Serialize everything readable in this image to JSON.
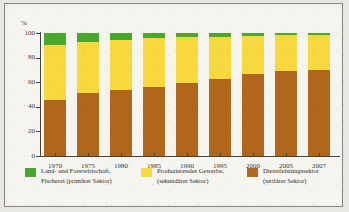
{
  "chart_data": {
    "type": "bar",
    "subtype": "100-percent-stacked-column",
    "title": "",
    "xlabel": "",
    "ylabel": "%",
    "unit_label": "%",
    "ylim": [
      0,
      100
    ],
    "yticks": [
      0,
      20,
      40,
      60,
      80,
      100
    ],
    "ytick_labels": [
      "0",
      "20",
      "40",
      "60",
      "80",
      "100"
    ],
    "grid": false,
    "legend_position": "bottom",
    "categories": [
      "1970",
      "1975",
      "1980",
      "1985",
      "1990",
      "1995",
      "2000",
      "2005",
      "2007"
    ],
    "series": [
      {
        "name": "Land- und Forstwirtschaft, Fischerei (primärer Sektor)",
        "short_name": "primärer Sektor",
        "color": "#4aa72e",
        "values": [
          9.5,
          7.0,
          5.5,
          4.0,
          3.5,
          3.0,
          2.5,
          2.0,
          2.0
        ]
      },
      {
        "name": "Produzierendes Gewerbe, (sekundärer Sektor)",
        "short_name": "sekundärer Sektor",
        "color": "#f7d83f",
        "values": [
          45.0,
          42.0,
          40.5,
          39.5,
          37.5,
          34.0,
          30.5,
          28.5,
          28.0
        ]
      },
      {
        "name": "Dienstleistungssektor (tertiärer Sektor)",
        "short_name": "tertiärer Sektor",
        "color": "#b0661b",
        "values": [
          45.5,
          51.0,
          54.0,
          56.5,
          59.0,
          63.0,
          67.0,
          69.5,
          70.0
        ]
      }
    ],
    "legend": [
      {
        "label_line1": "Land- und Forstwirtschaft,",
        "label_line2": "Fischerei (primärer Sektor)",
        "color": "#4aa72e"
      },
      {
        "label_line1": "Produzierendes Gewerbe,",
        "label_line2": "(sekundärer Sektor)",
        "color": "#f7d83f"
      },
      {
        "label_line1": "Dienstleistungssektor",
        "label_line2": "(tertiärer Sektor)",
        "color": "#b0661b"
      }
    ]
  }
}
